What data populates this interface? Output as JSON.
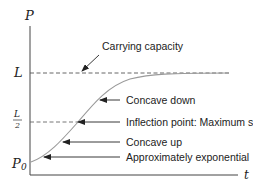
{
  "diagram": {
    "axes": {
      "y_label": "P",
      "x_label": "t"
    },
    "levels": {
      "L": "L",
      "half_num": "L",
      "half_den": "2",
      "P0_main": "P",
      "P0_sub": "0"
    },
    "annotations": [
      {
        "id": "carrying-capacity",
        "text": "Carrying capacity"
      },
      {
        "id": "concave-down",
        "text": "Concave down"
      },
      {
        "id": "inflection",
        "text": "Inflection point: Maximum slope"
      },
      {
        "id": "concave-up",
        "text": "Concave up"
      },
      {
        "id": "approx-exponential",
        "text": "Approximately exponential"
      }
    ],
    "colors": {
      "axis": "#333333",
      "curve": "#9a9a9a",
      "dashed": "#555555",
      "arrow": "#222222"
    }
  }
}
